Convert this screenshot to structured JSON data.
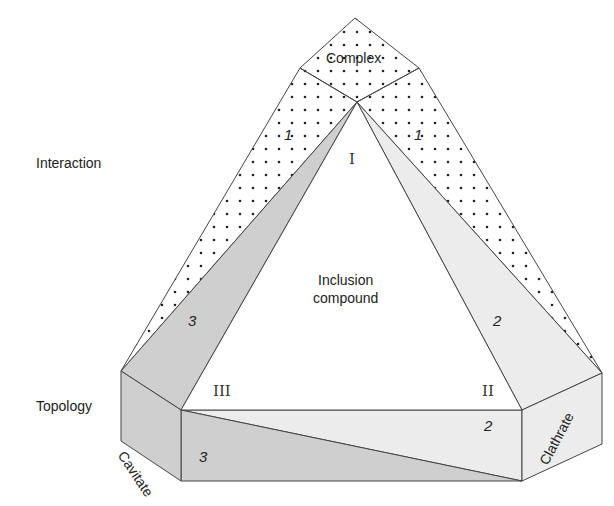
{
  "diagram": {
    "side_labels": {
      "interaction": "Interaction",
      "topology": "Topology"
    },
    "top_label": "Complex",
    "center_label_line1": "Inclusion",
    "center_label_line2": "compound",
    "left_block_label": "Cavitate",
    "right_block_label": "Clathrate",
    "roman": {
      "top": "I",
      "left": "III",
      "right": "II"
    },
    "band_numbers": {
      "left_upper": "1",
      "right_upper": "1",
      "left_band": "3",
      "right_band": "2",
      "bottom_left": "3",
      "bottom_right": "2"
    },
    "colors": {
      "stroke": "#444444",
      "dark_fill": "#cfcfcf",
      "light_fill": "#ececec",
      "dot": "#222222"
    }
  }
}
